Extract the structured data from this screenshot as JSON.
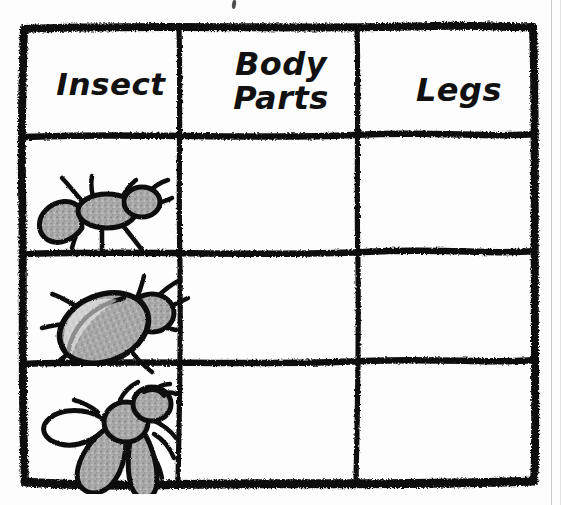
{
  "worksheet": {
    "title": "Insect Body Parts Chart",
    "ink_color": "#111111",
    "paper_color": "#fdfdfd",
    "fill_gray": "#a8a8a8"
  },
  "table": {
    "columns": [
      {
        "key": "insect",
        "label": "Insect"
      },
      {
        "key": "body_parts",
        "label": "Body\nParts"
      },
      {
        "key": "legs",
        "label": "Legs"
      }
    ],
    "rows": [
      {
        "insect_name": "ant",
        "insect_icon": "ant-drawing",
        "body_parts": "",
        "legs": ""
      },
      {
        "insect_name": "beetle",
        "insect_icon": "beetle-drawing",
        "body_parts": "",
        "legs": ""
      },
      {
        "insect_name": "fly",
        "insect_icon": "fly-drawing",
        "body_parts": "",
        "legs": ""
      }
    ]
  }
}
